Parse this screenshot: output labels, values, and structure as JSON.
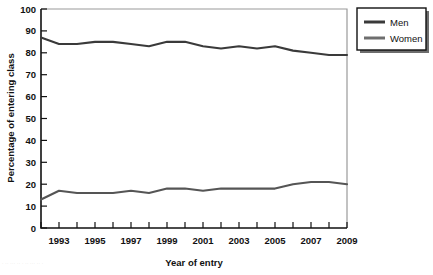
{
  "chart_data": {
    "type": "line",
    "title": "",
    "xlabel": "Year of entry",
    "ylabel": "Percentage of entering class",
    "xlim": [
      1992,
      2009
    ],
    "ylim": [
      0,
      100
    ],
    "grid": false,
    "legend_position": "top-right",
    "x": [
      1992,
      1993,
      1994,
      1995,
      1996,
      1997,
      1998,
      1999,
      2000,
      2001,
      2002,
      2003,
      2004,
      2005,
      2006,
      2007,
      2008,
      2009
    ],
    "xticks": [
      1992,
      1993,
      1994,
      1995,
      1996,
      1997,
      1998,
      1999,
      2000,
      2001,
      2002,
      2003,
      2004,
      2005,
      2006,
      2007,
      2008,
      2009
    ],
    "xticklabels": [
      "",
      "1993",
      "",
      "1995",
      "",
      "1997",
      "",
      "1999",
      "",
      "2001",
      "",
      "2003",
      "",
      "2005",
      "",
      "2007",
      "",
      "2009"
    ],
    "yticks": [
      0,
      10,
      20,
      30,
      40,
      50,
      60,
      70,
      80,
      90,
      100
    ],
    "yticklabels": [
      "0",
      "10",
      "20",
      "30",
      "40",
      "50",
      "60",
      "70",
      "80",
      "90",
      "100"
    ],
    "series": [
      {
        "name": "Men",
        "color": "#3a3a3a",
        "values": [
          87,
          84,
          84,
          85,
          85,
          84,
          83,
          85,
          85,
          83,
          82,
          83,
          82,
          83,
          81,
          80,
          79,
          79
        ]
      },
      {
        "name": "Women",
        "color": "#555555",
        "values": [
          13,
          17,
          16,
          16,
          16,
          17,
          16,
          18,
          18,
          17,
          18,
          18,
          18,
          18,
          20,
          21,
          21,
          20
        ]
      }
    ]
  },
  "legend": {
    "items": [
      {
        "label": "Men",
        "color": "#3a3a3a"
      },
      {
        "label": "Women",
        "color": "#6e6e6e"
      }
    ]
  },
  "axes": {
    "x_title": "Year of entry",
    "y_title": "Percentage of entering class"
  },
  "footer": {
    "artifact_text": "· ·· ··· ·· · ·· ··· ·· ·"
  },
  "colors": {
    "men_line": "#3a3a3a",
    "women_line": "#6e6e6e",
    "axis": "#000000",
    "frame": "#9a9a9a",
    "background": "#ffffff"
  }
}
